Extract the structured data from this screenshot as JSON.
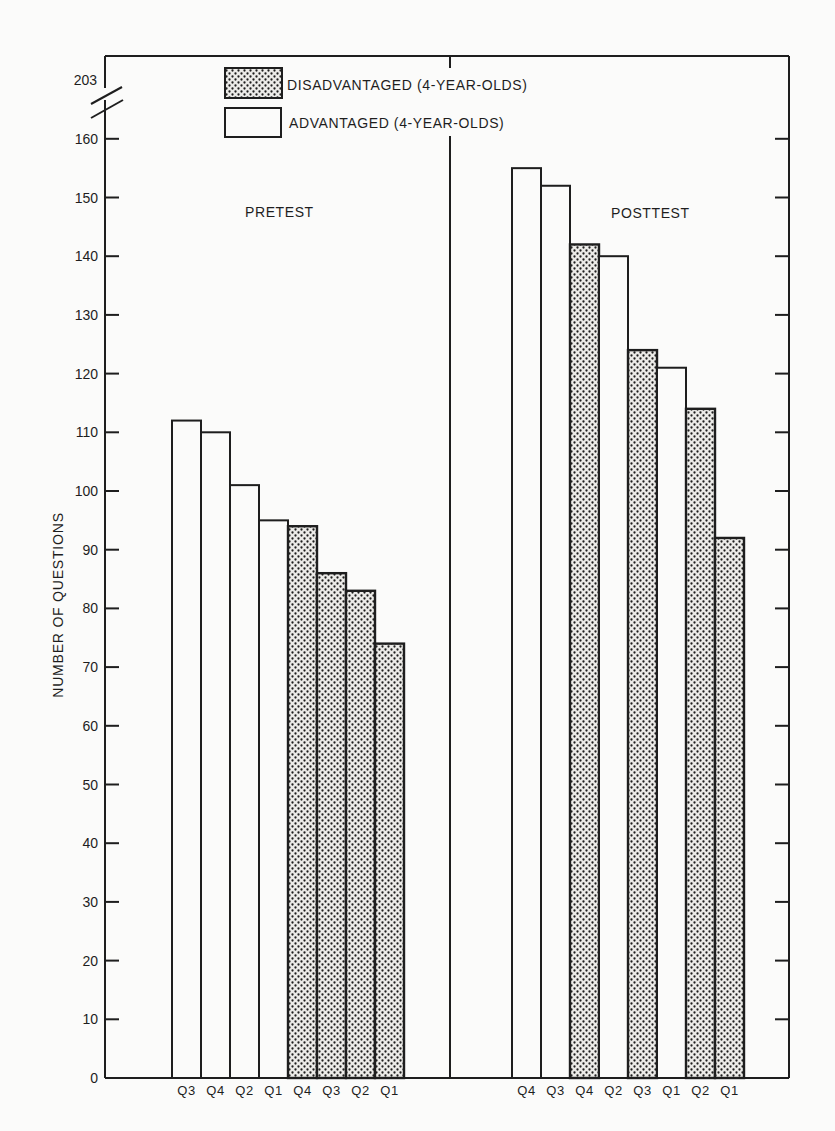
{
  "chart_data": {
    "type": "bar",
    "title": "",
    "xlabel": "",
    "ylabel": "NUMBER OF QUESTIONS",
    "ylim": [
      0,
      160
    ],
    "y_break": {
      "label": "203",
      "note": "axis break between 160 and 203"
    },
    "yticks": [
      0,
      10,
      20,
      30,
      40,
      50,
      60,
      70,
      80,
      90,
      100,
      110,
      120,
      130,
      140,
      150,
      160
    ],
    "grid": false,
    "legend": {
      "position": "top-left inside",
      "entries": [
        {
          "label": "DISADVANTAGED (4-YEAR-OLDS)",
          "pattern": "dotted"
        },
        {
          "label": "ADVANTAGED (4-YEAR-OLDS)",
          "pattern": "white"
        }
      ]
    },
    "panels": [
      {
        "label": "PRETEST",
        "bars": [
          {
            "category": "Q3",
            "group": "ADVANTAGED",
            "value": 112
          },
          {
            "category": "Q4",
            "group": "ADVANTAGED",
            "value": 110
          },
          {
            "category": "Q2",
            "group": "ADVANTAGED",
            "value": 101
          },
          {
            "category": "Q1",
            "group": "ADVANTAGED",
            "value": 95
          },
          {
            "category": "Q4",
            "group": "DISADVANTAGED",
            "value": 94
          },
          {
            "category": "Q3",
            "group": "DISADVANTAGED",
            "value": 86
          },
          {
            "category": "Q2",
            "group": "DISADVANTAGED",
            "value": 83
          },
          {
            "category": "Q1",
            "group": "DISADVANTAGED",
            "value": 74
          }
        ]
      },
      {
        "label": "POSTTEST",
        "bars": [
          {
            "category": "Q4",
            "group": "ADVANTAGED",
            "value": 155
          },
          {
            "category": "Q3",
            "group": "ADVANTAGED",
            "value": 152
          },
          {
            "category": "Q4",
            "group": "DISADVANTAGED",
            "value": 142
          },
          {
            "category": "Q2",
            "group": "ADVANTAGED",
            "value": 140
          },
          {
            "category": "Q3",
            "group": "DISADVANTAGED",
            "value": 124
          },
          {
            "category": "Q1",
            "group": "ADVANTAGED",
            "value": 121
          },
          {
            "category": "Q2",
            "group": "DISADVANTAGED",
            "value": 114
          },
          {
            "category": "Q1",
            "group": "DISADVANTAGED",
            "value": 92
          }
        ]
      }
    ]
  },
  "colors": {
    "ink": "#1e1e1e",
    "paper": "#fbfbfa",
    "dot_fill": "#e8e8e6"
  }
}
